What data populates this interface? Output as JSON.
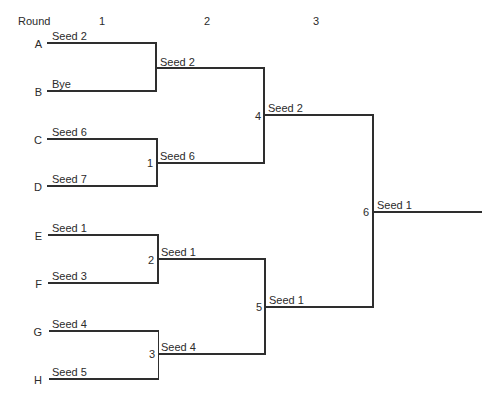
{
  "header": {
    "round_label": "Round",
    "rounds": [
      "1",
      "2",
      "3"
    ]
  },
  "entries": [
    {
      "slot": "A",
      "team": "Seed 2"
    },
    {
      "slot": "B",
      "team": "Bye"
    },
    {
      "slot": "C",
      "team": "Seed 6"
    },
    {
      "slot": "D",
      "team": "Seed 7"
    },
    {
      "slot": "E",
      "team": "Seed 1"
    },
    {
      "slot": "F",
      "team": "Seed 3"
    },
    {
      "slot": "G",
      "team": "Seed 4"
    },
    {
      "slot": "H",
      "team": "Seed 5"
    }
  ],
  "round2": [
    {
      "match": "",
      "winner": "Seed 2"
    },
    {
      "match": "1",
      "winner": "Seed 6"
    },
    {
      "match": "2",
      "winner": "Seed 1"
    },
    {
      "match": "3",
      "winner": "Seed 4"
    }
  ],
  "round3": [
    {
      "match": "4",
      "winner": "Seed 2"
    },
    {
      "match": "5",
      "winner": "Seed 1"
    }
  ],
  "final": {
    "match": "6",
    "winner": "Seed 1"
  }
}
